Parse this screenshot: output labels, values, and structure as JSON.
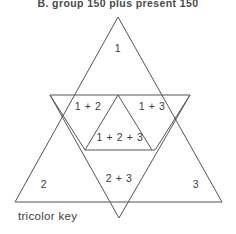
{
  "figure": {
    "heading": "B. group 150 plus present 150",
    "caption": "tricolor key",
    "stroke_color": "#555555",
    "text_color": "#3d3d3d",
    "background_color": "#ffffff"
  },
  "diagram": {
    "type": "venn-triangles",
    "regions": [
      {
        "id": "r1",
        "label": "1",
        "x": 118,
        "y": 48
      },
      {
        "id": "r12",
        "label": "1 + 2",
        "x": 88,
        "y": 106
      },
      {
        "id": "r13",
        "label": "1 + 3",
        "x": 152,
        "y": 106
      },
      {
        "id": "r123",
        "label": "1 + 2 + 3",
        "x": 120,
        "y": 137
      },
      {
        "id": "r2",
        "label": "2",
        "x": 44,
        "y": 184
      },
      {
        "id": "r23",
        "label": "2 + 3",
        "x": 119,
        "y": 178
      },
      {
        "id": "r3",
        "label": "3",
        "x": 196,
        "y": 184
      }
    ],
    "shapes": {
      "outer_triangle": "118,17 15,202 222,202",
      "inverted_triangle": "50,95 190,95 119,218",
      "inner_top_base": "50,95 190,95",
      "inner_small_base": "85,150 155,150",
      "left_inner_edge": "85,150 118,95",
      "right_inner_edge": "155,150 118,95"
    }
  }
}
